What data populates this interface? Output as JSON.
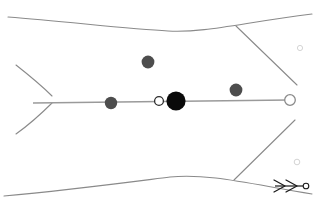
{
  "canvas": {
    "width": 316,
    "height": 206,
    "background": "#ffffff",
    "title": "schematic-outline-with-axis-markers"
  },
  "palette": {
    "outline_stroke": "#8a8a8a",
    "axis_stroke": "#9a9a9a",
    "marker_dark_gray": "#4d4d4d",
    "marker_black": "#0a0a0a",
    "marker_hollow_fill": "#ffffff",
    "marker_hollow_stroke": "#2b2b2b",
    "endpoint_hollow_stroke": "#8a8a8a",
    "faint_circle_stroke": "#c9c9c9",
    "arrow_stroke": "#1a1a1a"
  },
  "strokes": {
    "outline_width": 1.1,
    "axis_width": 1.6,
    "arrow_width": 1.2,
    "faint_width": 0.8
  },
  "outline_paths": [
    {
      "name": "top-boundary-curve",
      "d": "M 8 17 C 70 22, 130 29, 168 31 C 205 33, 240 23, 312 14"
    },
    {
      "name": "bottom-boundary-curve",
      "d": "M 4 196 C 70 190, 130 182, 170 177 C 208 173, 250 184, 312 194"
    },
    {
      "name": "left-tail-upper-curve",
      "d": "M 16 65 C 30 76, 42 86, 52 96"
    },
    {
      "name": "left-tail-lower-curve",
      "d": "M 16 134 C 30 124, 42 113, 52 103"
    },
    {
      "name": "right-upper-diagonal",
      "d": "M 236 26 L 297 85"
    },
    {
      "name": "right-lower-diagonal",
      "d": "M 234 180 L 295 120"
    }
  ],
  "axis": {
    "name": "main-horizontal-axis",
    "x1": 33,
    "y1": 103,
    "x2": 289,
    "y2": 100
  },
  "markers": [
    {
      "name": "marker-gray-left",
      "cx": 111,
      "cy": 103,
      "r": 6.2,
      "fill": "#4d4d4d",
      "stroke": "none",
      "label": "gray node left"
    },
    {
      "name": "marker-hollow-small",
      "cx": 159,
      "cy": 101,
      "r": 4.4,
      "fill": "#ffffff",
      "stroke": "#2b2b2b",
      "label": "hollow node center-left"
    },
    {
      "name": "marker-black-center",
      "cx": 176,
      "cy": 101,
      "r": 9.6,
      "fill": "#0a0a0a",
      "stroke": "none",
      "label": "black primary node"
    },
    {
      "name": "marker-gray-right",
      "cx": 236,
      "cy": 90,
      "r": 6.4,
      "fill": "#4d4d4d",
      "stroke": "none",
      "label": "gray node right"
    },
    {
      "name": "marker-gray-top",
      "cx": 148,
      "cy": 62,
      "r": 6.4,
      "fill": "#4d4d4d",
      "stroke": "none",
      "label": "gray node upper"
    },
    {
      "name": "marker-hollow-endpoint",
      "cx": 290,
      "cy": 100,
      "r": 5.3,
      "fill": "#ffffff",
      "stroke": "#8a8a8a",
      "label": "hollow endpoint right"
    }
  ],
  "faint_circles": [
    {
      "name": "faint-circle-upper-right",
      "cx": 300,
      "cy": 48,
      "r": 2.6
    },
    {
      "name": "faint-circle-lower-right",
      "cx": 297,
      "cy": 162,
      "r": 2.8
    }
  ],
  "arrow_annotation": {
    "name": "double-chevron-arrow",
    "shaft": {
      "x1": 275,
      "y1": 186,
      "x2": 303,
      "y2": 186
    },
    "chevrons": [
      {
        "d": "M 274 180 L 285 186 L 274 192"
      },
      {
        "d": "M 286 180 L 297 186 L 286 192"
      }
    ],
    "tip_circle": {
      "cx": 306,
      "cy": 186,
      "r": 2.8
    }
  }
}
